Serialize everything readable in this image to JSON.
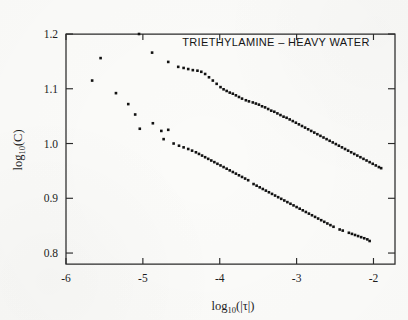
{
  "figure": {
    "background_color": "#fbfbf9",
    "ink_color": "#121212",
    "title": "TRIETHYLAMINE – HEAVY  WATER",
    "width": 408,
    "height": 320
  },
  "axes": {
    "x": {
      "label_main": "log",
      "label_sub": "10",
      "label_tail": "(|τ|)",
      "label_full": "log10(|τ|)",
      "ticks": [
        "-6",
        "-5",
        "-4",
        "-3",
        "-2"
      ],
      "tick_values": [
        -6,
        -5,
        -4,
        -3,
        -2
      ],
      "range": [
        -6.0,
        -1.72
      ],
      "tick_direction": "inward"
    },
    "y": {
      "label_main": "log",
      "label_sub": "10",
      "label_tail": "(C)",
      "label_full": "log10(C)",
      "ticks": [
        "0.8",
        "0.9",
        "1.0",
        "1.1",
        "1.2"
      ],
      "tick_values": [
        0.8,
        0.9,
        1.0,
        1.1,
        1.2
      ],
      "range": [
        0.78,
        1.2
      ],
      "tick_direction": "inward"
    },
    "frame": {
      "left": 66,
      "right": 395,
      "top": 34,
      "bottom": 264
    }
  },
  "chart_data": {
    "type": "scatter",
    "title": "TRIETHYLAMINE – HEAVY  WATER",
    "xlabel": "log10(|τ|)",
    "ylabel": "log10(C)",
    "xlim": [
      -6.0,
      -1.72
    ],
    "ylim": [
      0.78,
      1.2
    ],
    "grid": false,
    "legend": "none",
    "marker": "filled-square",
    "series": [
      {
        "name": "upper-branch",
        "marker_size_px": 2.6,
        "points": [
          [
            -5.05,
            1.2
          ],
          [
            -4.88,
            1.166
          ],
          [
            -4.67,
            1.149
          ],
          [
            -4.54,
            1.14
          ],
          [
            -4.47,
            1.138
          ],
          [
            -4.41,
            1.136
          ],
          [
            -4.35,
            1.134
          ],
          [
            -4.29,
            1.133
          ],
          [
            -4.24,
            1.131
          ],
          [
            -4.19,
            1.127
          ],
          [
            -4.14,
            1.121
          ],
          [
            -4.09,
            1.115
          ],
          [
            -4.04,
            1.109
          ],
          [
            -3.99,
            1.103
          ],
          [
            -3.95,
            1.099
          ],
          [
            -3.91,
            1.096
          ],
          [
            -3.87,
            1.093
          ],
          [
            -3.83,
            1.091
          ],
          [
            -3.79,
            1.088
          ],
          [
            -3.75,
            1.085
          ],
          [
            -3.71,
            1.082
          ],
          [
            -3.66,
            1.079
          ],
          [
            -3.62,
            1.077
          ],
          [
            -3.57,
            1.075
          ],
          [
            -3.53,
            1.073
          ],
          [
            -3.49,
            1.071
          ],
          [
            -3.45,
            1.068
          ],
          [
            -3.41,
            1.066
          ],
          [
            -3.37,
            1.063
          ],
          [
            -3.33,
            1.06
          ],
          [
            -3.29,
            1.058
          ],
          [
            -3.25,
            1.055
          ],
          [
            -3.21,
            1.052
          ],
          [
            -3.17,
            1.049
          ],
          [
            -3.13,
            1.047
          ],
          [
            -3.09,
            1.044
          ],
          [
            -3.05,
            1.041
          ],
          [
            -3.01,
            1.038
          ],
          [
            -2.97,
            1.035
          ],
          [
            -2.93,
            1.032
          ],
          [
            -2.89,
            1.029
          ],
          [
            -2.85,
            1.026
          ],
          [
            -2.81,
            1.023
          ],
          [
            -2.77,
            1.02
          ],
          [
            -2.73,
            1.017
          ],
          [
            -2.69,
            1.014
          ],
          [
            -2.65,
            1.011
          ],
          [
            -2.61,
            1.008
          ],
          [
            -2.57,
            1.005
          ],
          [
            -2.53,
            1.002
          ],
          [
            -2.49,
            0.999
          ],
          [
            -2.45,
            0.996
          ],
          [
            -2.41,
            0.993
          ],
          [
            -2.37,
            0.99
          ],
          [
            -2.33,
            0.987
          ],
          [
            -2.29,
            0.984
          ],
          [
            -2.25,
            0.981
          ],
          [
            -2.21,
            0.978
          ],
          [
            -2.17,
            0.975
          ],
          [
            -2.13,
            0.972
          ],
          [
            -2.09,
            0.969
          ],
          [
            -2.05,
            0.966
          ],
          [
            -2.01,
            0.963
          ],
          [
            -1.97,
            0.96
          ],
          [
            -1.93,
            0.957
          ],
          [
            -1.9,
            0.955
          ]
        ]
      },
      {
        "name": "lower-branch",
        "marker_size_px": 2.6,
        "points": [
          [
            -5.66,
            1.115
          ],
          [
            -5.55,
            1.156
          ],
          [
            -5.35,
            1.092
          ],
          [
            -5.19,
            1.072
          ],
          [
            -5.1,
            1.053
          ],
          [
            -5.04,
            1.027
          ],
          [
            -4.87,
            1.037
          ],
          [
            -4.76,
            1.023
          ],
          [
            -4.73,
            1.008
          ],
          [
            -4.67,
            1.025
          ],
          [
            -4.6,
            1.0
          ],
          [
            -4.53,
            0.996
          ],
          [
            -4.47,
            0.993
          ],
          [
            -4.41,
            0.99
          ],
          [
            -4.36,
            0.987
          ],
          [
            -4.31,
            0.984
          ],
          [
            -4.27,
            0.981
          ],
          [
            -4.23,
            0.978
          ],
          [
            -4.19,
            0.975
          ],
          [
            -4.15,
            0.972
          ],
          [
            -4.11,
            0.969
          ],
          [
            -4.07,
            0.966
          ],
          [
            -4.03,
            0.963
          ],
          [
            -3.99,
            0.96
          ],
          [
            -3.95,
            0.957
          ],
          [
            -3.91,
            0.954
          ],
          [
            -3.87,
            0.951
          ],
          [
            -3.83,
            0.948
          ],
          [
            -3.79,
            0.945
          ],
          [
            -3.75,
            0.942
          ],
          [
            -3.71,
            0.939
          ],
          [
            -3.67,
            0.936
          ],
          [
            -3.63,
            0.933
          ],
          [
            -3.56,
            0.926
          ],
          [
            -3.52,
            0.923
          ],
          [
            -3.48,
            0.92
          ],
          [
            -3.44,
            0.917
          ],
          [
            -3.4,
            0.914
          ],
          [
            -3.36,
            0.911
          ],
          [
            -3.32,
            0.908
          ],
          [
            -3.28,
            0.905
          ],
          [
            -3.24,
            0.902
          ],
          [
            -3.2,
            0.899
          ],
          [
            -3.16,
            0.896
          ],
          [
            -3.12,
            0.893
          ],
          [
            -3.08,
            0.89
          ],
          [
            -3.04,
            0.887
          ],
          [
            -3.0,
            0.884
          ],
          [
            -2.96,
            0.881
          ],
          [
            -2.92,
            0.878
          ],
          [
            -2.88,
            0.875
          ],
          [
            -2.84,
            0.872
          ],
          [
            -2.8,
            0.869
          ],
          [
            -2.76,
            0.866
          ],
          [
            -2.72,
            0.863
          ],
          [
            -2.68,
            0.86
          ],
          [
            -2.64,
            0.857
          ],
          [
            -2.6,
            0.854
          ],
          [
            -2.56,
            0.851
          ],
          [
            -2.52,
            0.848
          ],
          [
            -2.44,
            0.843
          ],
          [
            -2.4,
            0.841
          ],
          [
            -2.32,
            0.837
          ],
          [
            -2.28,
            0.835
          ],
          [
            -2.24,
            0.833
          ],
          [
            -2.2,
            0.831
          ],
          [
            -2.16,
            0.829
          ],
          [
            -2.12,
            0.827
          ],
          [
            -2.08,
            0.825
          ],
          [
            -2.05,
            0.822
          ]
        ]
      }
    ]
  }
}
